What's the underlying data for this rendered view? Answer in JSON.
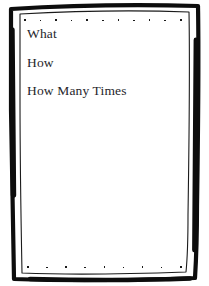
{
  "page": {
    "background_color": "#ffffff",
    "border_color": "#111111",
    "text_color": "#26262b",
    "width": 209,
    "height": 286
  },
  "frame": {
    "style": "hand-drawn-double-line",
    "outer_stroke_name": "outer-border-stroke",
    "inner_stroke_name": "inner-border-stroke"
  },
  "decorations": {
    "top_dot_row": {
      "count": 11,
      "color": "#1a1a1a"
    },
    "bottom_dot_row": {
      "count": 9,
      "color": "#1a1a1a"
    }
  },
  "content": {
    "lines": [
      {
        "text": "What"
      },
      {
        "text": "How"
      },
      {
        "text": "How Many Times"
      }
    ]
  }
}
